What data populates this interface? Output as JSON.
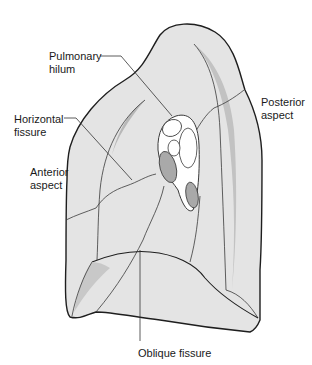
{
  "diagram": {
    "colors": {
      "lung_fill": "#e4e4e4",
      "lung_shadow": "#b8b8b8",
      "outline": "#1e1e1e",
      "fissure_line": "#3a3a3a",
      "hilum_fill": "#ffffff",
      "vessel_fill": "#a9a9a9",
      "leader_line": "#333333"
    },
    "labels": {
      "pulmonary_hilum_line1": "Pulmonary",
      "pulmonary_hilum_line2": "hilum",
      "horizontal_fissure_line1": "Horizontal",
      "horizontal_fissure_line2": "fissure",
      "anterior_aspect_line1": "Anterior",
      "anterior_aspect_line2": "aspect",
      "posterior_aspect_line1": "Posterior",
      "posterior_aspect_line2": "aspect",
      "oblique_fissure": "Oblique fissure"
    }
  }
}
